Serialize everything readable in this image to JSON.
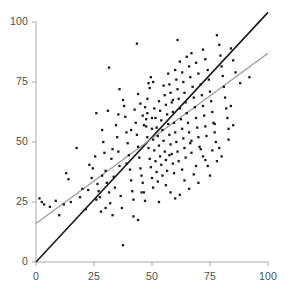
{
  "chart_data": {
    "type": "scatter",
    "title": "",
    "subtitle": "",
    "xlabel": "",
    "ylabel": "",
    "xlim": [
      0,
      100
    ],
    "ylim": [
      0,
      100
    ],
    "grid": false,
    "legend": "none",
    "axis_color": "#a8a8a8",
    "point_color": "#1a1a1a",
    "point_marker": "square",
    "point_size_px": 2.3,
    "xticks": [
      0,
      25,
      50,
      75,
      100
    ],
    "yticks": [
      0,
      25,
      50,
      75,
      100
    ],
    "xtick_labels": [
      "0",
      "25",
      "50",
      "75",
      "100"
    ],
    "ytick_labels": [
      "0",
      "25",
      "50",
      "75",
      "100"
    ],
    "annotations": [],
    "lines": [
      {
        "name": "identity-reference-line",
        "color": "#1a1a1a",
        "width": 1.6,
        "x": [
          0,
          100
        ],
        "y": [
          0,
          104
        ],
        "slope": 1.04,
        "intercept": 0
      },
      {
        "name": "regression-line",
        "color": "#9a9a9a",
        "width": 1.2,
        "x": [
          0,
          100
        ],
        "y": [
          16,
          87
        ],
        "slope": 0.71,
        "intercept": 16
      }
    ],
    "points": [
      [
        1.5,
        26.5
      ],
      [
        2.5,
        25.0
      ],
      [
        8.5,
        25.5
      ],
      [
        10.0,
        19.5
      ],
      [
        15.0,
        25.0
      ],
      [
        13.0,
        37.0
      ],
      [
        14.0,
        34.5
      ],
      [
        17.5,
        47.5
      ],
      [
        19.0,
        27.0
      ],
      [
        21.5,
        22.0
      ],
      [
        22.5,
        30.0
      ],
      [
        24.0,
        35.0
      ],
      [
        23.0,
        40.5
      ],
      [
        25.5,
        44.0
      ],
      [
        26.0,
        62.0
      ],
      [
        26.5,
        32.5
      ],
      [
        27.0,
        29.5
      ],
      [
        27.5,
        27.0
      ],
      [
        28.0,
        21.0
      ],
      [
        28.5,
        55.0
      ],
      [
        29.0,
        50.0
      ],
      [
        29.5,
        45.5
      ],
      [
        30.0,
        38.0
      ],
      [
        30.5,
        33.0
      ],
      [
        31.0,
        63.0
      ],
      [
        31.5,
        29.0
      ],
      [
        32.0,
        24.5
      ],
      [
        32.5,
        43.0
      ],
      [
        33.0,
        47.0
      ],
      [
        33.5,
        35.5
      ],
      [
        34.0,
        31.0
      ],
      [
        34.5,
        57.0
      ],
      [
        35.0,
        52.0
      ],
      [
        35.5,
        46.0
      ],
      [
        36.0,
        40.0
      ],
      [
        36.5,
        27.5
      ],
      [
        37.0,
        22.5
      ],
      [
        37.5,
        7.0
      ],
      [
        38.0,
        65.0
      ],
      [
        38.5,
        60.5
      ],
      [
        39.0,
        54.0
      ],
      [
        39.5,
        49.5
      ],
      [
        40.0,
        44.5
      ],
      [
        40.5,
        38.5
      ],
      [
        41.0,
        34.0
      ],
      [
        41.5,
        29.5
      ],
      [
        42.0,
        26.0
      ],
      [
        31.5,
        81.0
      ],
      [
        36.0,
        72.0
      ],
      [
        37.5,
        67.5
      ],
      [
        42.5,
        63.5
      ],
      [
        43.0,
        58.0
      ],
      [
        43.5,
        53.0
      ],
      [
        44.0,
        48.0
      ],
      [
        44.5,
        43.5
      ],
      [
        45.0,
        39.0
      ],
      [
        45.5,
        36.0
      ],
      [
        46.0,
        33.0
      ],
      [
        46.5,
        29.0
      ],
      [
        47.0,
        25.5
      ],
      [
        43.5,
        91.0
      ],
      [
        44.0,
        70.0
      ],
      [
        45.0,
        66.0
      ],
      [
        46.0,
        61.0
      ],
      [
        47.5,
        56.5
      ],
      [
        48.0,
        52.0
      ],
      [
        48.5,
        47.5
      ],
      [
        49.0,
        43.0
      ],
      [
        49.5,
        39.5
      ],
      [
        50.0,
        35.0
      ],
      [
        50.5,
        31.0
      ],
      [
        47.0,
        64.5
      ],
      [
        47.5,
        59.5
      ],
      [
        48.0,
        68.0
      ],
      [
        50.0,
        55.5
      ],
      [
        50.5,
        51.0
      ],
      [
        51.0,
        46.5
      ],
      [
        51.5,
        42.0
      ],
      [
        52.0,
        37.5
      ],
      [
        52.5,
        33.5
      ],
      [
        48.5,
        74.5
      ],
      [
        49.0,
        72.5
      ],
      [
        51.0,
        64.0
      ],
      [
        51.5,
        60.0
      ],
      [
        52.0,
        56.0
      ],
      [
        52.5,
        52.5
      ],
      [
        53.0,
        48.5
      ],
      [
        53.5,
        44.0
      ],
      [
        54.0,
        40.5
      ],
      [
        54.5,
        36.0
      ],
      [
        49.5,
        77.0
      ],
      [
        50.5,
        75.0
      ],
      [
        53.0,
        67.0
      ],
      [
        53.5,
        63.0
      ],
      [
        54.0,
        59.0
      ],
      [
        54.5,
        55.0
      ],
      [
        55.0,
        50.5
      ],
      [
        55.5,
        46.0
      ],
      [
        56.0,
        42.5
      ],
      [
        56.5,
        38.0
      ],
      [
        55.0,
        73.5
      ],
      [
        55.5,
        69.5
      ],
      [
        56.0,
        65.5
      ],
      [
        56.5,
        61.5
      ],
      [
        57.0,
        57.5
      ],
      [
        57.5,
        53.0
      ],
      [
        58.0,
        49.0
      ],
      [
        58.5,
        45.0
      ],
      [
        59.0,
        41.0
      ],
      [
        59.5,
        37.0
      ],
      [
        57.0,
        78.5
      ],
      [
        57.5,
        74.0
      ],
      [
        58.0,
        70.5
      ],
      [
        58.5,
        66.5
      ],
      [
        59.0,
        62.5
      ],
      [
        59.5,
        58.0
      ],
      [
        60.0,
        54.0
      ],
      [
        60.5,
        50.0
      ],
      [
        61.0,
        46.0
      ],
      [
        61.5,
        42.0
      ],
      [
        60.0,
        80.0
      ],
      [
        60.5,
        76.0
      ],
      [
        61.0,
        72.0
      ],
      [
        61.5,
        68.0
      ],
      [
        62.0,
        64.0
      ],
      [
        62.5,
        59.5
      ],
      [
        63.0,
        55.5
      ],
      [
        63.5,
        51.5
      ],
      [
        64.0,
        47.5
      ],
      [
        64.5,
        43.5
      ],
      [
        62.0,
        83.5
      ],
      [
        63.0,
        79.0
      ],
      [
        63.5,
        75.0
      ],
      [
        64.0,
        70.5
      ],
      [
        64.5,
        66.5
      ],
      [
        65.0,
        62.0
      ],
      [
        65.5,
        58.0
      ],
      [
        66.0,
        54.0
      ],
      [
        66.5,
        49.5
      ],
      [
        67.0,
        45.5
      ],
      [
        65.0,
        85.5
      ],
      [
        66.0,
        81.5
      ],
      [
        66.5,
        77.0
      ],
      [
        67.5,
        73.0
      ],
      [
        68.0,
        68.5
      ],
      [
        68.5,
        64.5
      ],
      [
        69.0,
        60.0
      ],
      [
        69.5,
        56.0
      ],
      [
        70.0,
        52.0
      ],
      [
        70.5,
        48.0
      ],
      [
        61.0,
        92.5
      ],
      [
        67.0,
        87.0
      ],
      [
        69.0,
        83.0
      ],
      [
        70.0,
        78.5
      ],
      [
        71.0,
        74.0
      ],
      [
        71.5,
        69.5
      ],
      [
        72.0,
        65.0
      ],
      [
        72.5,
        61.0
      ],
      [
        73.0,
        56.5
      ],
      [
        73.5,
        52.5
      ],
      [
        72.0,
        88.5
      ],
      [
        73.0,
        84.5
      ],
      [
        74.0,
        80.0
      ],
      [
        74.5,
        76.0
      ],
      [
        75.0,
        71.0
      ],
      [
        75.5,
        67.0
      ],
      [
        76.0,
        62.5
      ],
      [
        76.5,
        58.0
      ],
      [
        77.0,
        54.0
      ],
      [
        77.5,
        50.0
      ],
      [
        78.0,
        94.5
      ],
      [
        79.0,
        90.5
      ],
      [
        79.5,
        86.0
      ],
      [
        80.0,
        81.5
      ],
      [
        80.5,
        77.5
      ],
      [
        81.0,
        73.0
      ],
      [
        81.5,
        68.5
      ],
      [
        82.0,
        64.0
      ],
      [
        82.5,
        60.0
      ],
      [
        83.0,
        55.5
      ],
      [
        84.0,
        89.0
      ],
      [
        85.0,
        84.0
      ],
      [
        86.0,
        79.0
      ],
      [
        88.0,
        74.5
      ],
      [
        92.0,
        77.0
      ],
      [
        63.0,
        38.5
      ],
      [
        64.0,
        34.0
      ],
      [
        66.0,
        30.5
      ],
      [
        68.0,
        36.5
      ],
      [
        70.0,
        33.0
      ],
      [
        72.0,
        44.0
      ],
      [
        74.0,
        40.0
      ],
      [
        75.0,
        36.0
      ],
      [
        76.0,
        46.5
      ],
      [
        78.0,
        42.0
      ],
      [
        56.0,
        32.0
      ],
      [
        58.0,
        29.0
      ],
      [
        60.0,
        26.5
      ],
      [
        62.0,
        28.0
      ],
      [
        53.0,
        25.0
      ],
      [
        67.0,
        50.5
      ],
      [
        71.0,
        47.0
      ],
      [
        79.0,
        47.5
      ],
      [
        80.0,
        44.0
      ],
      [
        83.0,
        51.0
      ],
      [
        84.0,
        65.0
      ],
      [
        85.0,
        57.0
      ],
      [
        77.0,
        57.5
      ],
      [
        73.0,
        42.5
      ],
      [
        69.0,
        40.0
      ],
      [
        42.0,
        19.0
      ],
      [
        44.0,
        17.5
      ],
      [
        33.0,
        19.5
      ],
      [
        30.0,
        22.5
      ],
      [
        26.0,
        26.0
      ],
      [
        20.0,
        30.5
      ],
      [
        12.0,
        24.0
      ],
      [
        6.0,
        23.0
      ],
      [
        3.5,
        24.0
      ],
      [
        45.5,
        29.0
      ],
      [
        57.5,
        44.5
      ],
      [
        59.0,
        67.5
      ],
      [
        50.0,
        60.0
      ],
      [
        48.0,
        62.0
      ],
      [
        46.5,
        57.0
      ],
      [
        41.0,
        55.0
      ],
      [
        39.0,
        41.0
      ],
      [
        35.5,
        61.5
      ],
      [
        28.5,
        36.0
      ],
      [
        24.5,
        39.0
      ]
    ]
  }
}
